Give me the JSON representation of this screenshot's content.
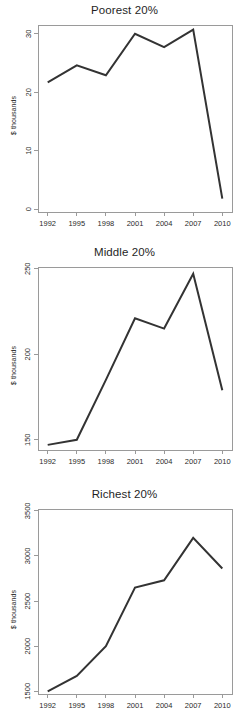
{
  "figure": {
    "width": 249,
    "height": 727,
    "background": "#ffffff",
    "line_color": "#333333",
    "axis_color": "#9a9a9a",
    "shared_xlabel_ticks": [
      "1992",
      "1995",
      "1998",
      "2001",
      "2004",
      "2007",
      "2010"
    ],
    "shared_ylabel": "$ thousands"
  },
  "chart_data": [
    {
      "type": "line",
      "title": "Poorest 20%",
      "xlabel": "",
      "ylabel": "$ thousands",
      "x": [
        1992,
        1995,
        1998,
        2001,
        2004,
        2007,
        2010
      ],
      "xtick_labels": [
        "1992",
        "1995",
        "1998",
        "2001",
        "2004",
        "2007",
        "2010"
      ],
      "values": [
        21.7,
        24.6,
        22.9,
        30.0,
        27.7,
        30.7,
        1.8
      ],
      "ytick_labels": [
        "0",
        "10",
        "20",
        "30"
      ],
      "yticks": [
        0,
        10,
        20,
        30
      ],
      "ylim": [
        -0.5,
        31.5
      ],
      "xlim": [
        1991.0,
        2011.0
      ],
      "grid": false,
      "legend": "none",
      "series": [
        {
          "name": "Poorest 20%",
          "values": [
            21.7,
            24.6,
            22.9,
            30.0,
            27.7,
            30.7,
            1.8
          ]
        }
      ]
    },
    {
      "type": "line",
      "title": "Middle 20%",
      "xlabel": "",
      "ylabel": "$ thousands",
      "x": [
        1992,
        1995,
        1998,
        2001,
        2004,
        2007,
        2010
      ],
      "xtick_labels": [
        "1992",
        "1995",
        "1998",
        "2001",
        "2004",
        "2007",
        "2010"
      ],
      "values": [
        147,
        150,
        185,
        221,
        215,
        247,
        179
      ],
      "ytick_labels": [
        "150",
        "200",
        "250"
      ],
      "yticks": [
        150,
        200,
        250
      ],
      "ylim": [
        144,
        251
      ],
      "xlim": [
        1991.0,
        2011.0
      ],
      "grid": false,
      "legend": "none",
      "series": [
        {
          "name": "Middle 20%",
          "values": [
            147,
            150,
            185,
            221,
            215,
            247,
            179
          ]
        }
      ]
    },
    {
      "type": "line",
      "title": "Richest 20%",
      "xlabel": "",
      "ylabel": "$ thousands",
      "x": [
        1992,
        1995,
        1998,
        2001,
        2004,
        2007,
        2010
      ],
      "xtick_labels": [
        "1992",
        "1995",
        "1998",
        "2001",
        "2004",
        "2007",
        "2010"
      ],
      "values": [
        1500,
        1670,
        2000,
        2650,
        2730,
        3200,
        2860
      ],
      "ytick_labels": [
        "1500",
        "2000",
        "2500",
        "3000",
        "3500"
      ],
      "yticks": [
        1500,
        2000,
        2500,
        3000,
        3500
      ],
      "ylim": [
        1470,
        3520
      ],
      "xlim": [
        1991.0,
        2011.0
      ],
      "grid": false,
      "legend": "none",
      "series": [
        {
          "name": "Richest 20%",
          "values": [
            1500,
            1670,
            2000,
            2650,
            2730,
            3200,
            2860
          ]
        }
      ]
    }
  ]
}
